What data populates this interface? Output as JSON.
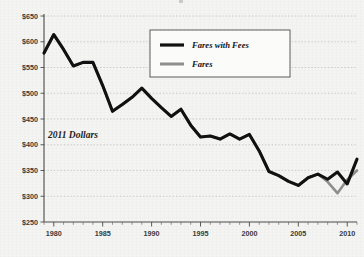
{
  "chart_data": {
    "type": "line",
    "title": "",
    "xlabel": "",
    "ylabel": "",
    "annotation": "2011 Dollars",
    "ylim": [
      250,
      650
    ],
    "xlim": [
      1979,
      2011
    ],
    "ytick_step": 50,
    "ytick_labels": [
      "$250",
      "$300",
      "$350",
      "$400",
      "$450",
      "$500",
      "$550",
      "$600",
      "$650"
    ],
    "ytick_values": [
      250,
      300,
      350,
      400,
      450,
      500,
      550,
      600,
      650
    ],
    "xtick_labels": [
      "1980",
      "1985",
      "1990",
      "1995",
      "2000",
      "2005",
      "2010"
    ],
    "xtick_values": [
      1980,
      1985,
      1990,
      1995,
      2000,
      2005,
      2010
    ],
    "minor_xticks": true,
    "grid": "horizontal-dotted",
    "legend_position": "top-center",
    "x": [
      1979,
      1980,
      1981,
      1982,
      1983,
      1984,
      1985,
      1986,
      1987,
      1988,
      1989,
      1990,
      1991,
      1992,
      1993,
      1994,
      1995,
      1996,
      1997,
      1998,
      1999,
      2000,
      2001,
      2002,
      2003,
      2004,
      2005,
      2006,
      2007,
      2008,
      2009,
      2010,
      2011
    ],
    "series": [
      {
        "name": "Fares with Fees",
        "color": "#111111",
        "values": [
          578,
          614,
          585,
          553,
          560,
          560,
          515,
          465,
          478,
          492,
          510,
          490,
          472,
          455,
          469,
          438,
          415,
          417,
          411,
          421,
          411,
          420,
          388,
          348,
          340,
          329,
          321,
          336,
          343,
          333,
          347,
          324,
          372
        ]
      },
      {
        "name": "Fares",
        "color": "#8e8e8e",
        "values": [
          578,
          614,
          585,
          553,
          560,
          560,
          515,
          465,
          478,
          492,
          510,
          490,
          472,
          455,
          469,
          438,
          415,
          417,
          411,
          421,
          411,
          420,
          388,
          348,
          340,
          329,
          321,
          336,
          343,
          328,
          306,
          332,
          350
        ]
      }
    ]
  },
  "legend": {
    "items": [
      {
        "label": "Fares with Fees",
        "swatch": "black-line-swatch"
      },
      {
        "label": "Fares",
        "swatch": "gray-line-swatch"
      }
    ]
  }
}
